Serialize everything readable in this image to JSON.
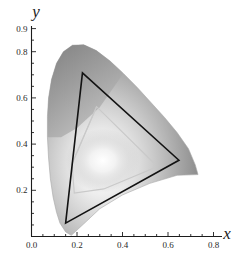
{
  "figure": {
    "kind": "cie-chromaticity-diagram",
    "background_color": "#ffffff",
    "axis_color": "#1c1c1c",
    "title": ""
  },
  "axes": {
    "x_axis_label": "x",
    "y_axis_label": "y",
    "x_ticks_major": [
      "0.0",
      "0.2",
      "0.4",
      "0.6",
      "0.8"
    ],
    "x_tick_values": [
      0.0,
      0.2,
      0.4,
      0.6,
      0.8
    ],
    "x_minor_step": 0.05,
    "y_ticks_major": [
      "0.2",
      "0.4",
      "0.6",
      "0.8",
      "0.9"
    ],
    "y_tick_values": [
      0.2,
      0.4,
      0.6,
      0.8,
      0.9
    ],
    "y_minor_step": 0.05,
    "xlim": [
      0.0,
      0.82
    ],
    "ylim": [
      0.0,
      0.9
    ],
    "grid": false
  },
  "chart_data": {
    "type": "scatter",
    "title": "",
    "xlabel": "x",
    "ylabel": "y",
    "xlim": [
      0.0,
      0.82
    ],
    "ylim": [
      0.0,
      0.9
    ],
    "grid": false,
    "legend_position": "none",
    "series": [
      {
        "name": "spectral-locus",
        "kind": "filled-region",
        "fill_style": "grayscale-chromaticity-gradient",
        "outline_color": "#9a9a9a",
        "points": [
          [
            0.175,
            0.005
          ],
          [
            0.15,
            0.02
          ],
          [
            0.125,
            0.058
          ],
          [
            0.11,
            0.105
          ],
          [
            0.095,
            0.17
          ],
          [
            0.083,
            0.25
          ],
          [
            0.075,
            0.34
          ],
          [
            0.07,
            0.43
          ],
          [
            0.07,
            0.52
          ],
          [
            0.075,
            0.6
          ],
          [
            0.088,
            0.68
          ],
          [
            0.11,
            0.75
          ],
          [
            0.14,
            0.8
          ],
          [
            0.18,
            0.828
          ],
          [
            0.23,
            0.83
          ],
          [
            0.285,
            0.805
          ],
          [
            0.345,
            0.76
          ],
          [
            0.405,
            0.705
          ],
          [
            0.465,
            0.645
          ],
          [
            0.525,
            0.58
          ],
          [
            0.585,
            0.515
          ],
          [
            0.64,
            0.45
          ],
          [
            0.69,
            0.38
          ],
          [
            0.72,
            0.31
          ],
          [
            0.732,
            0.268
          ],
          [
            0.64,
            0.265
          ],
          [
            0.52,
            0.23
          ],
          [
            0.4,
            0.18
          ],
          [
            0.3,
            0.12
          ],
          [
            0.23,
            0.055
          ]
        ]
      },
      {
        "name": "outer-gamut-triangle",
        "kind": "polyline-closed",
        "stroke_color": "#121212",
        "stroke_width": 1.6,
        "vertices": [
          [
            0.224,
            0.708
          ],
          [
            0.648,
            0.33
          ],
          [
            0.15,
            0.058
          ]
        ]
      },
      {
        "name": "inner-gamut-polygon",
        "kind": "polyline-closed",
        "stroke_color": "#c9c9c9",
        "stroke_width": 1.1,
        "vertices": [
          [
            0.286,
            0.562
          ],
          [
            0.54,
            0.316
          ],
          [
            0.538,
            0.296
          ],
          [
            0.318,
            0.206
          ],
          [
            0.188,
            0.188
          ],
          [
            0.178,
            0.315
          ]
        ]
      },
      {
        "name": "inner-gamut-chord",
        "kind": "polyline-open",
        "stroke_color": "#c9c9c9",
        "stroke_width": 1.1,
        "vertices": [
          [
            0.178,
            0.315
          ],
          [
            0.286,
            0.562
          ]
        ]
      },
      {
        "name": "white-point-glow",
        "kind": "radial-highlight",
        "center": [
          0.313,
          0.329
        ],
        "radius": 0.12
      }
    ]
  }
}
